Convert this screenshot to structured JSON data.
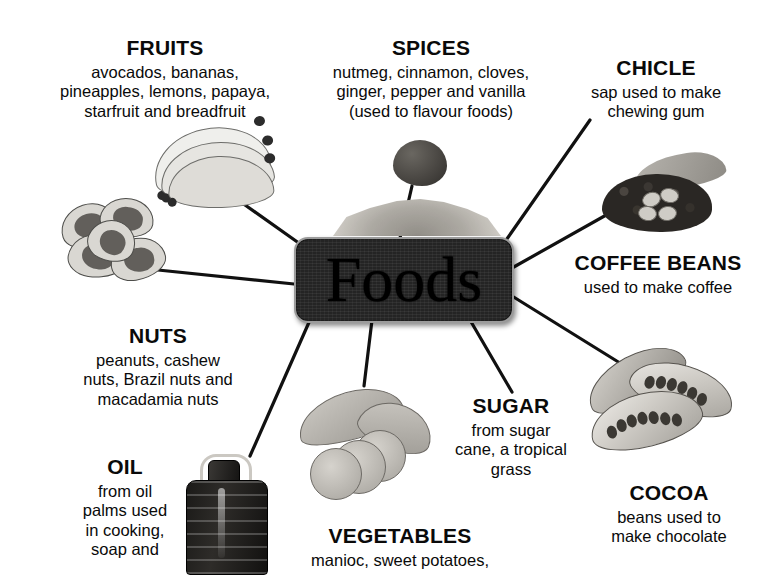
{
  "diagram": {
    "title": "Foods",
    "center": {
      "label": "Foods",
      "shape": "rounded-rectangle",
      "fill": "#242424",
      "border": "#9b9b9b"
    },
    "background": "#ffffff",
    "line_color": "#111111",
    "branches": [
      {
        "id": "fruits",
        "heading": "FRUITS",
        "body": "avocados, bananas,\npineapples, lemons, papaya,\nstarfruit and breadfruit",
        "body_lines": [
          "avocados, bananas,",
          "pineapples, lemons, papaya,",
          "starfruit and breadfruit"
        ],
        "image": "bananas-photo"
      },
      {
        "id": "spices",
        "heading": "SPICES",
        "body_lines": [
          "nutmeg, cinnamon, cloves,",
          "ginger, pepper and vanilla",
          "(used to flavour foods)"
        ],
        "image": "nutmeg-and-ground-spice-photo"
      },
      {
        "id": "chicle",
        "heading": "CHICLE",
        "body_lines": [
          "sap used to make",
          "chewing gum"
        ],
        "image": null
      },
      {
        "id": "coffee-beans",
        "heading": "COFFEE BEANS",
        "body_lines": [
          "used to make coffee"
        ],
        "image": "coffee-beans-photo"
      },
      {
        "id": "cocoa",
        "heading": "COCOA",
        "body_lines": [
          "beans used to",
          "make chocolate"
        ],
        "image": "cocoa-pods-photo"
      },
      {
        "id": "sugar",
        "heading": "SUGAR",
        "body_lines": [
          "from sugar",
          "cane, a tropical",
          "grass"
        ],
        "image": null
      },
      {
        "id": "vegetables",
        "heading": "VEGETABLES",
        "body_lines": [
          "manioc, sweet potatoes,"
        ],
        "image": "sweet-potatoes-photo",
        "note": "text clipped by image edge"
      },
      {
        "id": "oil",
        "heading": "OIL",
        "body_lines": [
          "from oil",
          "palms used",
          "in cooking,",
          "soap and"
        ],
        "image": "oil-bottle-photo",
        "note": "text clipped by image edge"
      },
      {
        "id": "nuts",
        "heading": "NUTS",
        "body_lines": [
          "peanuts, cashew",
          "nuts, Brazil nuts and",
          "macadamia nuts"
        ],
        "image": "brazil-nuts-photo"
      }
    ]
  }
}
